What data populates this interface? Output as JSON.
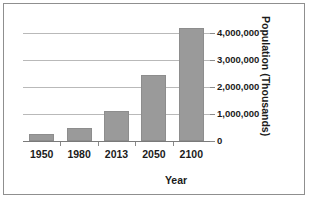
{
  "chart_data": {
    "type": "bar",
    "title": "",
    "xlabel": "Year",
    "ylabel": "Population (Thousands)",
    "categories": [
      "1950",
      "1980",
      "2013",
      "2050",
      "2100"
    ],
    "values": [
      250000,
      480000,
      1120000,
      2420000,
      4180000
    ],
    "ylim": [
      0,
      4500000
    ],
    "yticks": [
      0,
      1000000,
      2000000,
      3000000,
      4000000
    ],
    "ytick_labels": [
      "0",
      "1,000,000",
      "2,000,000",
      "3,000,000",
      "4,000,000"
    ],
    "grid": true,
    "legend": "none",
    "series": [
      {
        "name": "Population",
        "values": [
          250000,
          480000,
          1120000,
          2420000,
          4180000
        ]
      }
    ],
    "colors": {
      "bar_fill": "#9a9a9a",
      "bar_border": "#8d8d8d",
      "gridline": "#b9b9b9",
      "axis": "#7a7a7a",
      "text": "#1b1b1b",
      "frame_border": "#8f8f8f",
      "background": "#ffffff"
    }
  }
}
